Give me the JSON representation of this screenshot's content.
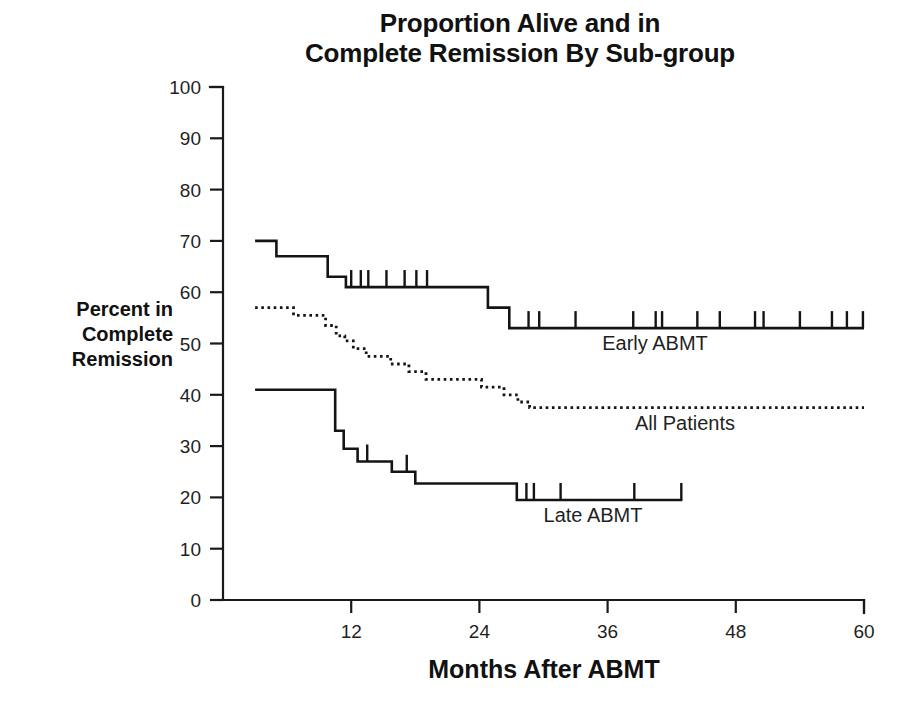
{
  "chart_data": {
    "type": "line",
    "title": "Proportion Alive and in\nComplete Remission By Sub-group",
    "xlabel": "Months After ABMT",
    "ylabel": "Percent in\nComplete\nRemission",
    "xlim": [
      0,
      60
    ],
    "ylim": [
      0,
      100
    ],
    "xticks": [
      0,
      12,
      24,
      36,
      48,
      60
    ],
    "xtick_labels": [
      "0",
      "12",
      "24",
      "36",
      "48",
      "60"
    ],
    "yticks": [
      0,
      10,
      20,
      30,
      40,
      50,
      60,
      70,
      80,
      90,
      100
    ],
    "ytick_labels": [
      "0",
      "10",
      "20",
      "30",
      "40",
      "50",
      "60",
      "70",
      "80",
      "90",
      "100"
    ],
    "grid": false,
    "legend": "inline-annotations",
    "style": "Kaplan-Meier step curves with censoring tick marks",
    "series": [
      {
        "name": "Early ABMT",
        "label": "Early ABMT",
        "line_style": "solid",
        "steps": [
          {
            "x": 3.0,
            "y": 70
          },
          {
            "x": 5.0,
            "y": 70
          },
          {
            "x": 5.0,
            "y": 67
          },
          {
            "x": 9.8,
            "y": 67
          },
          {
            "x": 9.8,
            "y": 63
          },
          {
            "x": 11.5,
            "y": 63
          },
          {
            "x": 11.5,
            "y": 61
          },
          {
            "x": 24.8,
            "y": 61
          },
          {
            "x": 24.8,
            "y": 57
          },
          {
            "x": 26.8,
            "y": 57
          },
          {
            "x": 26.8,
            "y": 53
          },
          {
            "x": 60.0,
            "y": 53
          }
        ],
        "censor_months": [
          12.0,
          12.9,
          13.6,
          15.3,
          17.0,
          18.1,
          19.1,
          28.6,
          29.6,
          33.0,
          38.4,
          40.5,
          41.1,
          44.4,
          46.5,
          49.8,
          50.6,
          54.0,
          57.0,
          58.4,
          59.9
        ],
        "start_value": 70,
        "final_value": 53
      },
      {
        "name": "All Patients",
        "label": "All Patients",
        "line_style": "dotted",
        "steps": [
          {
            "x": 3.0,
            "y": 57
          },
          {
            "x": 6.6,
            "y": 57
          },
          {
            "x": 6.6,
            "y": 55.5
          },
          {
            "x": 9.6,
            "y": 55.5
          },
          {
            "x": 9.6,
            "y": 53.5
          },
          {
            "x": 10.6,
            "y": 53.5
          },
          {
            "x": 10.6,
            "y": 51.5
          },
          {
            "x": 11.4,
            "y": 51.5
          },
          {
            "x": 11.4,
            "y": 50.5
          },
          {
            "x": 12.2,
            "y": 50.5
          },
          {
            "x": 12.2,
            "y": 49
          },
          {
            "x": 13.4,
            "y": 49
          },
          {
            "x": 13.4,
            "y": 47.5
          },
          {
            "x": 15.7,
            "y": 47.5
          },
          {
            "x": 15.7,
            "y": 46
          },
          {
            "x": 17.4,
            "y": 46
          },
          {
            "x": 17.4,
            "y": 44.5
          },
          {
            "x": 19.0,
            "y": 44.5
          },
          {
            "x": 19.0,
            "y": 43
          },
          {
            "x": 24.2,
            "y": 43
          },
          {
            "x": 24.2,
            "y": 41.5
          },
          {
            "x": 26.3,
            "y": 41.5
          },
          {
            "x": 26.3,
            "y": 40
          },
          {
            "x": 27.6,
            "y": 40
          },
          {
            "x": 27.6,
            "y": 38.6
          },
          {
            "x": 28.7,
            "y": 38.6
          },
          {
            "x": 28.7,
            "y": 37.5
          },
          {
            "x": 60.0,
            "y": 37.5
          }
        ],
        "censor_months": [],
        "start_value": 57,
        "final_value": 37.5
      },
      {
        "name": "Late ABMT",
        "label": "Late ABMT",
        "line_style": "solid",
        "steps": [
          {
            "x": 3.0,
            "y": 41
          },
          {
            "x": 10.5,
            "y": 41
          },
          {
            "x": 10.5,
            "y": 33
          },
          {
            "x": 11.3,
            "y": 33
          },
          {
            "x": 11.3,
            "y": 29.5
          },
          {
            "x": 12.6,
            "y": 29.5
          },
          {
            "x": 12.6,
            "y": 27
          },
          {
            "x": 15.8,
            "y": 27
          },
          {
            "x": 15.8,
            "y": 25
          },
          {
            "x": 18.0,
            "y": 25
          },
          {
            "x": 18.0,
            "y": 22.7
          },
          {
            "x": 27.5,
            "y": 22.7
          },
          {
            "x": 27.5,
            "y": 19.5
          },
          {
            "x": 43.0,
            "y": 19.5
          }
        ],
        "censor_months": [
          13.5,
          17.2,
          28.4,
          29.1,
          31.6,
          38.5,
          42.9
        ],
        "start_value": 41,
        "final_value": 19.5
      }
    ]
  },
  "annotations": {
    "early_label": "Early ABMT",
    "all_label": "All Patients",
    "late_label": "Late ABMT"
  }
}
